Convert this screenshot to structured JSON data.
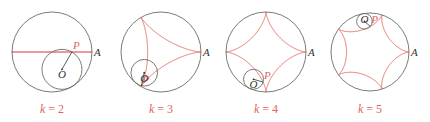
{
  "colors": {
    "circle": "#6b6b6b",
    "curve": "#e0655a",
    "text": "#333333",
    "caption": "#e0655a"
  },
  "panels": [
    {
      "k": 2,
      "caption_var": "k",
      "caption_eq": " = 2",
      "labels": {
        "P": "P",
        "A": "A",
        "O": "O"
      }
    },
    {
      "k": 3,
      "caption_var": "k",
      "caption_eq": " = 3",
      "labels": {
        "P": "P",
        "A": "A",
        "O": "O"
      }
    },
    {
      "k": 4,
      "caption_var": "k",
      "caption_eq": " = 4",
      "labels": {
        "P": "P",
        "A": "A",
        "O": "O"
      }
    },
    {
      "k": 5,
      "caption_var": "k",
      "caption_eq": " = 5",
      "labels": {
        "P": "P",
        "A": "A",
        "O": "O"
      }
    }
  ]
}
